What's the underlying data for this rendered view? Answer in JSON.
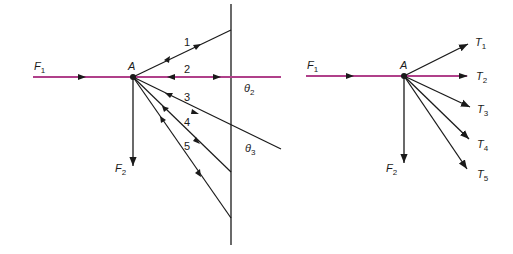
{
  "colors": {
    "force_line": "#b0408a",
    "ray_line": "#1a1a1a",
    "background": "#ffffff"
  },
  "left_diagram": {
    "point_label": "A",
    "F1": {
      "label": "F",
      "sub": "1"
    },
    "F2": {
      "label": "F",
      "sub": "2"
    },
    "rays": [
      {
        "label": "1"
      },
      {
        "label": "2"
      },
      {
        "label": "3"
      },
      {
        "label": "4"
      },
      {
        "label": "5"
      }
    ],
    "angles": [
      {
        "label": "θ",
        "sub": "2"
      },
      {
        "label": "θ",
        "sub": "3"
      }
    ]
  },
  "right_diagram": {
    "point_label": "A",
    "F1": {
      "label": "F",
      "sub": "1"
    },
    "F2": {
      "label": "F",
      "sub": "2"
    },
    "tensions": [
      {
        "label": "T",
        "sub": "1"
      },
      {
        "label": "T",
        "sub": "2"
      },
      {
        "label": "T",
        "sub": "3"
      },
      {
        "label": "T",
        "sub": "4"
      },
      {
        "label": "T",
        "sub": "5"
      }
    ]
  }
}
